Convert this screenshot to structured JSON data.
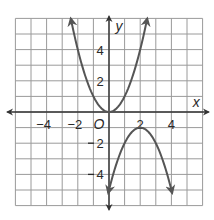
{
  "chart_data": {
    "type": "line",
    "title": "",
    "xlabel": "x",
    "ylabel": "y",
    "origin_label": "O",
    "xlim": [
      -6,
      6
    ],
    "ylim": [
      -6,
      6
    ],
    "grid": true,
    "x_ticks": [
      -4,
      -2,
      2,
      4
    ],
    "y_ticks": [
      4,
      2,
      -2,
      -4
    ],
    "x_tick_labels": [
      "−4",
      "−2",
      "2",
      "4"
    ],
    "y_tick_labels": [
      "4",
      "2",
      "2",
      "4"
    ],
    "series": [
      {
        "name": "upper parabola",
        "equation": "y = x^2",
        "vertex": [
          0,
          0
        ],
        "points": [
          [
            -2.45,
            6
          ],
          [
            -2,
            4
          ],
          [
            -1,
            1
          ],
          [
            0,
            0
          ],
          [
            1,
            1
          ],
          [
            2,
            4
          ],
          [
            2.45,
            6
          ]
        ],
        "color": "#555555"
      },
      {
        "name": "lower parabola",
        "equation": "y = -(x-2)^2 - 1",
        "vertex": [
          2,
          -1
        ],
        "points": [
          [
            -0.05,
            -6
          ],
          [
            0,
            -5
          ],
          [
            1,
            -2
          ],
          [
            2,
            -1
          ],
          [
            3,
            -2
          ],
          [
            4,
            -5
          ],
          [
            4.05,
            -6
          ]
        ],
        "color": "#555555"
      }
    ]
  }
}
